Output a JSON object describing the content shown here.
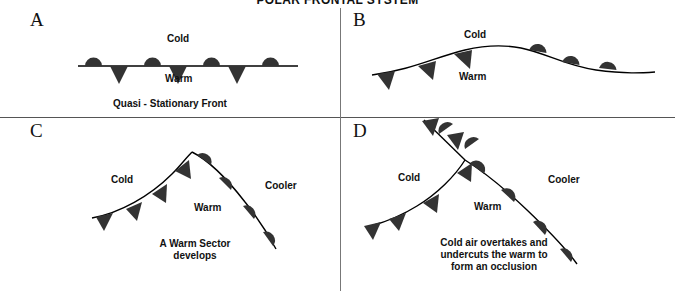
{
  "figure": {
    "title": "POLAR FRONTAL SYSTEM",
    "symbol_color": "#333333",
    "line_color": "#000000",
    "divider_color": "#555555",
    "background": "#ffffff"
  },
  "panels": {
    "a": {
      "letter": "A",
      "cold_label": "Cold",
      "warm_label": "Warm",
      "caption": "Quasi - Stationary Front",
      "front_type": "stationary"
    },
    "b": {
      "letter": "B",
      "cold_label": "Cold",
      "warm_label": "Warm",
      "front_type": "wave"
    },
    "c": {
      "letter": "C",
      "cold_label": "Cold",
      "warm_label": "Warm",
      "cooler_label": "Cooler",
      "caption": "A Warm Sector\ndevelops",
      "front_type": "open-wave"
    },
    "d": {
      "letter": "D",
      "cold_label": "Cold",
      "warm_label": "Warm",
      "cooler_label": "Cooler",
      "caption": "Cold air overtakes and\nundercuts the warm to\nform an occlusion",
      "front_type": "occluded"
    }
  }
}
